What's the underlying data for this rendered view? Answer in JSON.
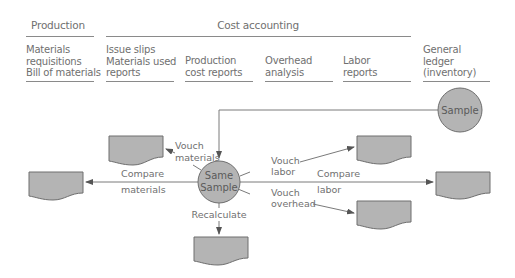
{
  "header": {
    "production_label": "Production",
    "cost_accounting_label": "Cost accounting"
  },
  "columns": [
    {
      "lines": [
        "Materials",
        "requisitions",
        "Bill of materials"
      ]
    },
    {
      "lines": [
        "Issue slips",
        "Materials used",
        "reports"
      ]
    },
    {
      "lines": [
        "Production",
        "cost reports"
      ]
    },
    {
      "lines": [
        "Overhead",
        "analysis"
      ]
    },
    {
      "lines": [
        "Labor",
        "reports"
      ]
    },
    {
      "lines": [
        "General",
        "ledger",
        "(inventory)"
      ]
    }
  ],
  "nodes": {
    "sample": "Sample",
    "same_sample": [
      "Same",
      "Sample"
    ]
  },
  "edges": {
    "vouch_materials": [
      "Vouch",
      "materials"
    ],
    "compare_materials": [
      "Compare",
      "materials"
    ],
    "recalculate": "Recalculate",
    "vouch_labor": [
      "Vouch",
      "labor"
    ],
    "compare_labor": [
      "Compare",
      "labor"
    ],
    "vouch_overhead": [
      "Vouch",
      "overhead"
    ]
  },
  "colors": {
    "node_fill": "#b4b4b4",
    "stroke": "#6e6e6e",
    "text": "#707070"
  }
}
